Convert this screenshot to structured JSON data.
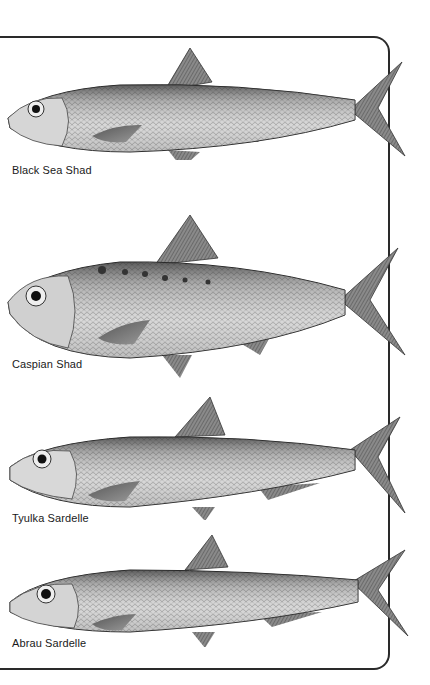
{
  "plate": {
    "frame_color": "#2a2a2a",
    "species": [
      {
        "name": "Black Sea Shad",
        "illustration": "fish-illustration"
      },
      {
        "name": "Caspian Shad",
        "illustration": "fish-illustration"
      },
      {
        "name": "Tyulka Sardelle",
        "illustration": "fish-illustration"
      },
      {
        "name": "Abrau Sardelle",
        "illustration": "fish-illustration"
      }
    ]
  }
}
